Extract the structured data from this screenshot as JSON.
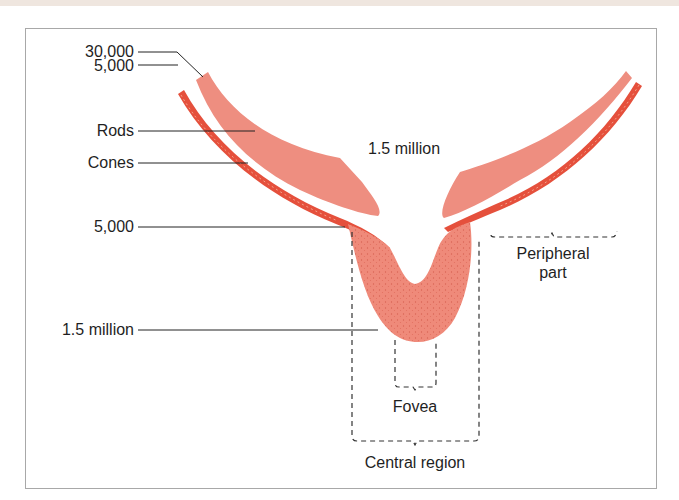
{
  "diagram": {
    "title": "",
    "colors": {
      "rods": "#ee8e80",
      "cones": "#e5503c",
      "cones_highlight": "#f4a08a",
      "fovea_fill": "#ef8a7a",
      "line": "#222222",
      "frame": "#a8a8a8"
    },
    "left_labels": [
      {
        "id": "cone-density-peripheral",
        "text": "30,000"
      },
      {
        "id": "rod-density-peripheral",
        "text": "5,000"
      },
      {
        "id": "rods",
        "text": "Rods"
      },
      {
        "id": "cones",
        "text": "Cones"
      },
      {
        "id": "cone-density-central",
        "text": "5,000"
      },
      {
        "id": "cone-density-fovea",
        "text": "1.5 million"
      }
    ],
    "center_label": "1.5 million",
    "regions": {
      "peripheral_line1": "Peripheral",
      "peripheral_line2": "part",
      "fovea": "Fovea",
      "central": "Central region"
    }
  }
}
